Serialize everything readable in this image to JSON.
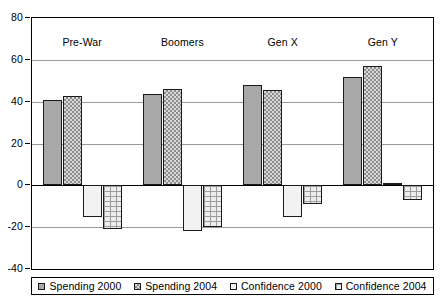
{
  "chart_data": {
    "type": "bar",
    "title": "",
    "subtitle": "",
    "xlabel": "",
    "ylabel": "",
    "categories": [
      "Pre-War",
      "Boomers",
      "Gen X",
      "Gen Y"
    ],
    "series": [
      {
        "name": "Spending 2000",
        "values": [
          41,
          43.5,
          48,
          52
        ]
      },
      {
        "name": "Spending 2004",
        "values": [
          42.5,
          46,
          45.5,
          57
        ]
      },
      {
        "name": "Confidence 2000",
        "values": [
          -15,
          -22,
          -15,
          1
        ]
      },
      {
        "name": "Confidence 2004",
        "values": [
          -21,
          -20,
          -9,
          -7
        ]
      }
    ],
    "ylim": [
      -40,
      80
    ],
    "ytick_values": [
      80,
      60,
      40,
      20,
      0,
      -20,
      -40
    ],
    "ytick_labels": [
      "80",
      "60",
      "40",
      "20",
      "0",
      "-20",
      "-40"
    ],
    "grid": true,
    "legend_position": "bottom",
    "legend_entries": [
      "Spending 2000",
      "Spending 2004",
      "Confidence 2000",
      "Confidence 2004"
    ],
    "series_fills": [
      "solid-gray",
      "checkered",
      "light-dotted",
      "brick-dotted"
    ],
    "colors": {
      "spending_2000": "#a8a8a8",
      "spending_2004": "#d8d8d8",
      "confidence_2000": "#f2f2f2",
      "confidence_2004": "#ededed",
      "axis": "#000000",
      "gridline": "#9a9a9a"
    }
  }
}
